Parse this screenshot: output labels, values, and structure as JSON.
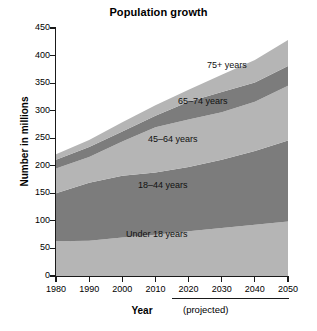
{
  "chart_data": {
    "type": "area",
    "title": "Population growth",
    "xlabel": "Year",
    "ylabel": "Number in millions",
    "xlim": [
      1980,
      2050
    ],
    "ylim": [
      0,
      450
    ],
    "grid": false,
    "legend_position": "inline-annotations",
    "stacked": true,
    "x": [
      1980,
      1990,
      2000,
      2010,
      2020,
      2030,
      2040,
      2050
    ],
    "xticklabels": [
      "1980",
      "1990",
      "2000",
      "2010",
      "2020",
      "2030",
      "2040",
      "2050"
    ],
    "yticks": [
      0,
      50,
      100,
      150,
      200,
      250,
      300,
      350,
      400,
      450
    ],
    "yticklabels": [
      "0",
      "50",
      "100",
      "150",
      "200",
      "250",
      "300",
      "350",
      "400",
      "450"
    ],
    "annotation": "(projected)",
    "projected_from": 2010,
    "series": [
      {
        "name": "Under 18 years",
        "color": "#b5b5b5",
        "values": [
          63,
          64,
          70,
          75,
          81,
          87,
          93,
          99
        ]
      },
      {
        "name": "18–44 years",
        "color": "#7c7c7c",
        "values": [
          87,
          105,
          112,
          113,
          117,
          124,
          134,
          147
        ]
      },
      {
        "name": "45–64 years",
        "color": "#b5b5b5",
        "values": [
          45,
          47,
          62,
          82,
          86,
          86,
          89,
          99
        ]
      },
      {
        "name": "65–74 years",
        "color": "#7c7c7c",
        "values": [
          16,
          18,
          18,
          21,
          32,
          37,
          35,
          36
        ]
      },
      {
        "name": "75+ years",
        "color": "#b5b5b5",
        "values": [
          10,
          13,
          17,
          19,
          22,
          31,
          41,
          47
        ]
      }
    ],
    "cumulative_tops": {
      "1980": [
        63,
        150,
        195,
        211,
        221
      ],
      "1990": [
        64,
        169,
        216,
        234,
        247
      ],
      "2000": [
        70,
        182,
        244,
        262,
        279
      ],
      "2010": [
        75,
        188,
        270,
        291,
        310
      ],
      "2020": [
        81,
        198,
        284,
        316,
        338
      ],
      "2030": [
        87,
        211,
        297,
        334,
        365
      ],
      "2040": [
        93,
        227,
        316,
        351,
        392
      ],
      "2050": [
        99,
        246,
        345,
        381,
        428
      ]
    }
  },
  "labels": {
    "band_under18": "Under 18 years",
    "band_18_44": "18–44 years",
    "band_45_64": "45–64 years",
    "band_65_74": "65–74 years",
    "band_75plus": "75+ years"
  },
  "colors": {
    "light_band": "#b5b5b5",
    "dark_band": "#7c7c7c",
    "axis": "#1a1a1a",
    "background": "#ffffff"
  }
}
